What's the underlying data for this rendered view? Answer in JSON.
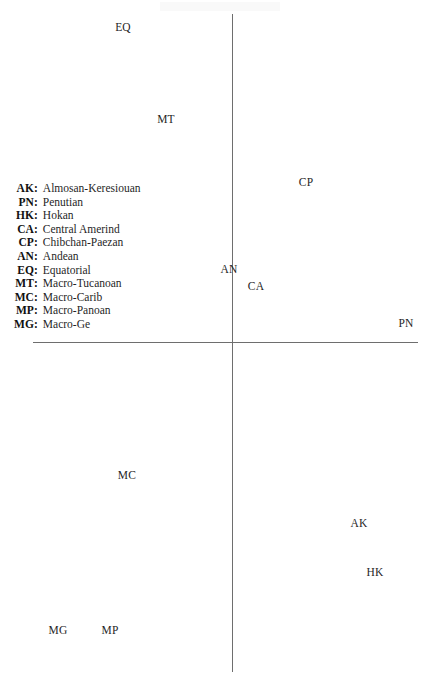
{
  "chart_data": {
    "type": "scatter",
    "title": "",
    "subtitle": "",
    "xlabel": "",
    "ylabel": "",
    "grid": false,
    "axes_style": "crossed-axes-through-origin",
    "tick_labels": [],
    "legend_position": "left-middle",
    "axis_extent": {
      "vertical_x": 232,
      "vertical_y_top": 14,
      "vertical_y_bottom": 672,
      "horizontal_y": 342,
      "horizontal_x_left": 33,
      "horizontal_x_right": 418
    },
    "point_label_field": "code",
    "points": [
      {
        "code": "EQ",
        "name": "Equatorial",
        "x": 123,
        "y": 28
      },
      {
        "code": "MT",
        "name": "Macro-Tucanoan",
        "x": 166,
        "y": 120
      },
      {
        "code": "CP",
        "name": "Chibchan-Paezan",
        "x": 306,
        "y": 183
      },
      {
        "code": "AN",
        "name": "Andean",
        "x": 229,
        "y": 270
      },
      {
        "code": "CA",
        "name": "Central Amerind",
        "x": 256,
        "y": 287
      },
      {
        "code": "PN",
        "name": "Penutian",
        "x": 406,
        "y": 324
      },
      {
        "code": "MC",
        "name": "Macro-Carib",
        "x": 127,
        "y": 476
      },
      {
        "code": "AK",
        "name": "Almosan-Keresiouan",
        "x": 359,
        "y": 524
      },
      {
        "code": "HK",
        "name": "Hokan",
        "x": 375,
        "y": 573
      },
      {
        "code": "MG",
        "name": "Macro-Ge",
        "x": 58,
        "y": 631
      },
      {
        "code": "MP",
        "name": "Macro-Panoan",
        "x": 110,
        "y": 631
      }
    ]
  },
  "legend": {
    "entries": [
      {
        "code": "AK",
        "name": "Almosan-Keresiouan"
      },
      {
        "code": "PN",
        "name": "Penutian"
      },
      {
        "code": "HK",
        "name": "Hokan"
      },
      {
        "code": "CA",
        "name": "Central Amerind"
      },
      {
        "code": "CP",
        "name": "Chibchan-Paezan"
      },
      {
        "code": "AN",
        "name": "Andean"
      },
      {
        "code": "EQ",
        "name": "Equatorial"
      },
      {
        "code": "MT",
        "name": "Macro-Tucanoan"
      },
      {
        "code": "MC",
        "name": "Macro-Carib"
      },
      {
        "code": "MP",
        "name": "Macro-Panoan"
      },
      {
        "code": "MG",
        "name": "Macro-Ge"
      }
    ],
    "separator": ":"
  },
  "colors": {
    "axis": "#6e6e6e",
    "text": "#1f1f1f",
    "legend_code": "#111111",
    "background": "#ffffff"
  }
}
